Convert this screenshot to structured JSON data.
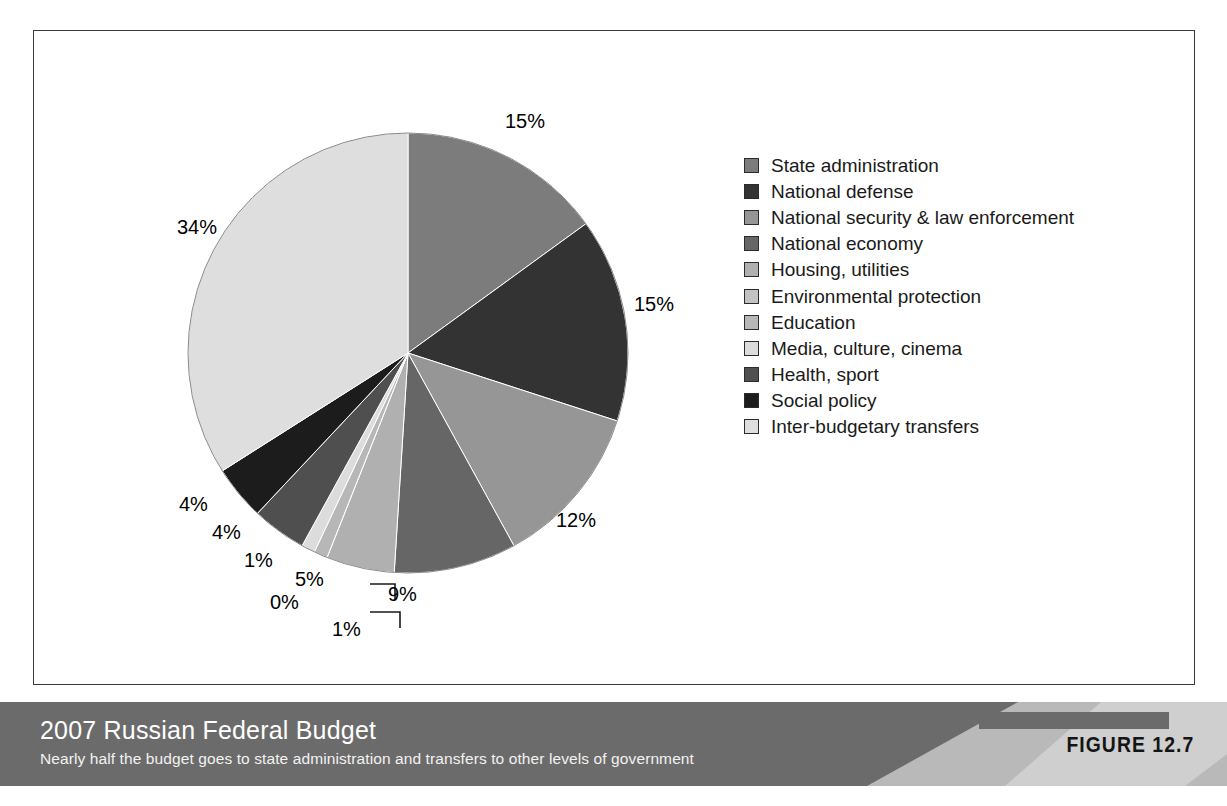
{
  "figure": {
    "number_label": "FIGURE 12.7",
    "title": "2007 Russian Federal Budget",
    "subtitle": "Nearly half the budget goes to state administration and transfers to other levels of government"
  },
  "chart_data": {
    "type": "pie",
    "title": "2007 Russian Federal Budget",
    "subtitle": "Nearly half the budget goes to state administration and transfers to other levels of government",
    "xlabel": "",
    "ylabel": "",
    "units": "percent of budget",
    "start_angle_deg": 0,
    "direction": "clockwise",
    "legend_position": "right",
    "grid": false,
    "categories": [
      "State administration",
      "National defense",
      "National security & law enforcement",
      "National economy",
      "Housing, utilities",
      "Environmental protection",
      "Education",
      "Media, culture, cinema",
      "Health, sport",
      "Social policy",
      "Inter-budgetary transfers"
    ],
    "values": [
      15,
      15,
      12,
      9,
      5,
      0,
      1,
      1,
      4,
      4,
      34
    ],
    "data_labels": [
      "15%",
      "15%",
      "12%",
      "9%",
      "5%",
      "0%",
      "1%",
      "1%",
      "4%",
      "4%",
      "34%"
    ],
    "colors": [
      "#7c7c7c",
      "#333333",
      "#969696",
      "#666666",
      "#b0b0b0",
      "#c2c2c2",
      "#b7b7b7",
      "#dcdcdc",
      "#4f4f4f",
      "#1c1c1c",
      "#dedede"
    ],
    "slices": [
      {
        "label": "State administration",
        "value": 15,
        "data_label": "15%",
        "color": "#7c7c7c"
      },
      {
        "label": "National defense",
        "value": 15,
        "data_label": "15%",
        "color": "#333333"
      },
      {
        "label": "National security & law enforcement",
        "value": 12,
        "data_label": "12%",
        "color": "#969696"
      },
      {
        "label": "National economy",
        "value": 9,
        "data_label": "9%",
        "color": "#666666"
      },
      {
        "label": "Housing, utilities",
        "value": 5,
        "data_label": "5%",
        "color": "#b0b0b0"
      },
      {
        "label": "Environmental protection",
        "value": 0,
        "data_label": "0%",
        "color": "#c2c2c2"
      },
      {
        "label": "Education",
        "value": 1,
        "data_label": "1%",
        "color": "#b7b7b7"
      },
      {
        "label": "Media, culture, cinema",
        "value": 1,
        "data_label": "1%",
        "color": "#dcdcdc"
      },
      {
        "label": "Health, sport",
        "value": 4,
        "data_label": "4%",
        "color": "#4f4f4f"
      },
      {
        "label": "Social policy",
        "value": 4,
        "data_label": "4%",
        "color": "#1c1c1c"
      },
      {
        "label": "Inter-budgetary transfers",
        "value": 34,
        "data_label": "34%",
        "color": "#dedede"
      }
    ]
  },
  "pct_labels": [
    {
      "text": "15%",
      "x": 505,
      "y": 110
    },
    {
      "text": "15%",
      "x": 634,
      "y": 293
    },
    {
      "text": "12%",
      "x": 556,
      "y": 509
    },
    {
      "text": "9%",
      "x": 388,
      "y": 583
    },
    {
      "text": "5%",
      "x": 295,
      "y": 568
    },
    {
      "text": "0%",
      "x": 270,
      "y": 591
    },
    {
      "text": "1%",
      "x": 332,
      "y": 618
    },
    {
      "text": "1%",
      "x": 244,
      "y": 549
    },
    {
      "text": "4%",
      "x": 212,
      "y": 521
    },
    {
      "text": "4%",
      "x": 179,
      "y": 493
    },
    {
      "text": "34%",
      "x": 177,
      "y": 216
    }
  ]
}
